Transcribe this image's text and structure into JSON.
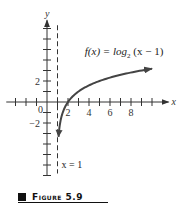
{
  "chart_data": {
    "type": "line",
    "title": "",
    "function_label": "f(x) = log₂ (x − 1)",
    "function_label_parts": {
      "lhs": "f(x) = log",
      "sub": "2",
      "rhs": " (x − 1)"
    },
    "xlabel": "x",
    "ylabel": "y",
    "xlim": [
      -3.5,
      11
    ],
    "ylim": [
      -7,
      7.5
    ],
    "x_ticks": [
      -3,
      -2,
      -1,
      1,
      2,
      3,
      4,
      5,
      6,
      7,
      8,
      9,
      10
    ],
    "x_tick_labels": [
      {
        "value": 2,
        "label": "2"
      },
      {
        "value": 4,
        "label": "4"
      },
      {
        "value": 6,
        "label": "6"
      },
      {
        "value": 8,
        "label": "8"
      }
    ],
    "y_ticks": [
      -7,
      -6,
      -5,
      -4,
      -3,
      -2,
      -1,
      1,
      2,
      3,
      4,
      5,
      6,
      7
    ],
    "y_tick_labels": [
      {
        "value": 2,
        "label": "2"
      },
      {
        "value": -2,
        "label": "−2"
      }
    ],
    "origin_label": "0",
    "asymptote": {
      "x": 1,
      "label": "x = 1",
      "style": "dashed"
    },
    "series": [
      {
        "name": "f(x) = log2(x - 1)",
        "domain": [
          1.1,
          10
        ],
        "x": [
          1.1,
          1.25,
          1.5,
          2,
          2.5,
          3,
          4,
          5,
          6,
          7,
          8,
          9,
          10
        ],
        "y": [
          -3.32,
          -2.0,
          -1.0,
          0,
          0.58,
          1.0,
          1.58,
          2.0,
          2.32,
          2.58,
          2.81,
          3.0,
          3.17
        ],
        "color": "#444444",
        "arrows": "both"
      }
    ],
    "grid": false,
    "legend": "none"
  },
  "caption": {
    "label": "Figure 5.9"
  }
}
